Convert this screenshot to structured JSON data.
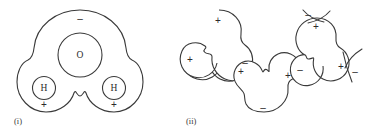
{
  "figure": {
    "background_color": "#ffffff",
    "stroke_color": "#3a3a3a",
    "panels": [
      {
        "id": "panel-i",
        "caption": "(i)",
        "caption_x": 14,
        "caption_y": 122,
        "description": "single water molecule showing partial charges",
        "atoms": [
          {
            "symbol": "O",
            "cx": 80,
            "cy": 55,
            "r": 22
          },
          {
            "symbol": "H",
            "cx": 44,
            "cy": 88,
            "r": 11.5
          },
          {
            "symbol": "H",
            "cx": 114,
            "cy": 88,
            "r": 11.5
          }
        ],
        "charges": [
          {
            "sign": "–",
            "x": 80,
            "y": 19
          },
          {
            "sign": "+",
            "x": 44,
            "y": 105
          },
          {
            "sign": "+",
            "x": 114,
            "y": 105
          }
        ]
      },
      {
        "id": "panel-ii",
        "caption": "(ii)",
        "caption_x": 186,
        "caption_y": 122,
        "description": "three hydrogen-bonded water molecules in a network",
        "molecules": [
          {
            "id": "molecule-left",
            "charges": [
              {
                "sign": "+",
                "x": 218,
                "y": 21
              },
              {
                "sign": "+",
                "x": 190,
                "y": 60
              },
              {
                "sign": "–",
                "x": 245,
                "y": 63
              }
            ]
          },
          {
            "id": "molecule-middle",
            "charges": [
              {
                "sign": "+",
                "x": 241,
                "y": 72
              },
              {
                "sign": "+",
                "x": 288,
                "y": 76
              },
              {
                "sign": "–",
                "x": 263,
                "y": 108
              }
            ]
          },
          {
            "id": "molecule-right",
            "charges": [
              {
                "sign": "+",
                "x": 316,
                "y": 27
              },
              {
                "sign": "–",
                "x": 308,
                "y": 18
              },
              {
                "sign": "–",
                "x": 300,
                "y": 70
              },
              {
                "sign": "+",
                "x": 341,
                "y": 67
              },
              {
                "sign": "–",
                "x": 354,
                "y": 72
              }
            ]
          }
        ]
      }
    ]
  }
}
